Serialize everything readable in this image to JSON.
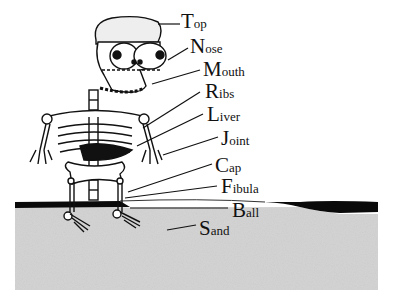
{
  "diagram": {
    "type": "labeled-illustration",
    "labels": [
      {
        "initial": "T",
        "rest": "op",
        "full": "Top",
        "x": 181,
        "y": 11
      },
      {
        "initial": "N",
        "rest": "ose",
        "full": "Nose",
        "x": 190,
        "y": 36
      },
      {
        "initial": "M",
        "rest": "outh",
        "full": "Mouth",
        "x": 203,
        "y": 59
      },
      {
        "initial": "R",
        "rest": "ibs",
        "full": "Ribs",
        "x": 205,
        "y": 81
      },
      {
        "initial": "L",
        "rest": "iver",
        "full": "Liver",
        "x": 207,
        "y": 104
      },
      {
        "initial": "J",
        "rest": "oint",
        "full": "Joint",
        "x": 221,
        "y": 128
      },
      {
        "initial": "C",
        "rest": "ap",
        "full": "Cap",
        "x": 215,
        "y": 155
      },
      {
        "initial": "F",
        "rest": "ibula",
        "full": "Fibula",
        "x": 221,
        "y": 176
      },
      {
        "initial": "B",
        "rest": "all",
        "full": "Ball",
        "x": 232,
        "y": 202
      },
      {
        "initial": "S",
        "rest": "and",
        "full": "Sand",
        "x": 199,
        "y": 218
      }
    ],
    "colors": {
      "ink": "#111111",
      "sand": "#c9c9c9",
      "ground": "#0a0a0a",
      "background": "#ffffff"
    }
  }
}
